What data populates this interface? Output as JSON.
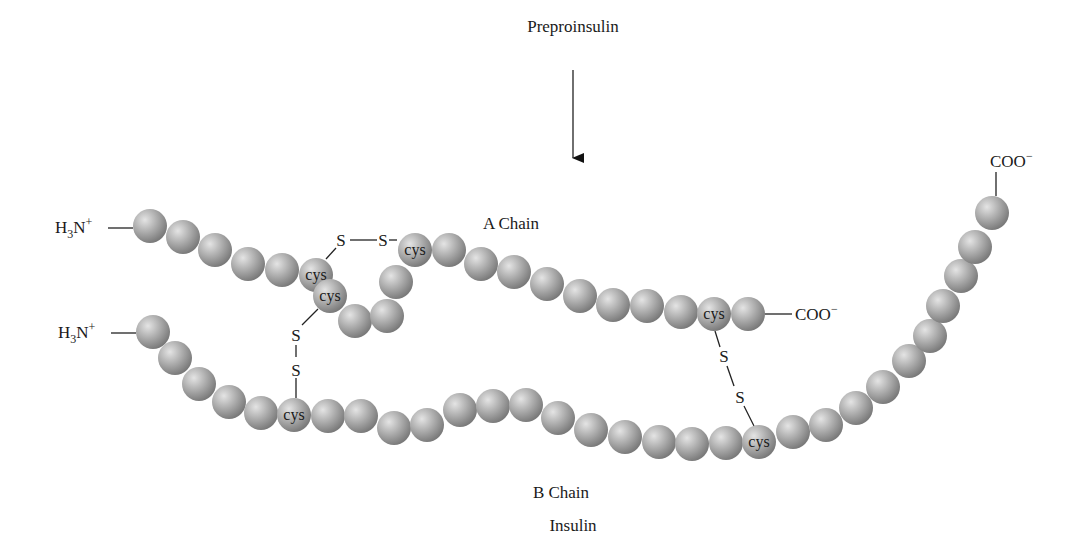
{
  "title_top": "Preproinsulin",
  "title_bottom": "Insulin",
  "colors": {
    "bead_light": "#d2d2d2",
    "bead_mid": "#a9a9a9",
    "bead_dark": "#7b7b7b",
    "text": "#1a1a1a",
    "background": "#ffffff"
  },
  "bead_radius": 17,
  "a_chain": {
    "label": "A Chain",
    "n_terminus": "H₃N⁺",
    "c_terminus": "COO⁻",
    "beads": [
      [
        150,
        226
      ],
      [
        183,
        237
      ],
      [
        215,
        250
      ],
      [
        248,
        264
      ],
      [
        282,
        270
      ],
      [
        316,
        275,
        "cys"
      ],
      [
        330,
        296,
        "cys"
      ],
      [
        355,
        321
      ],
      [
        387,
        316
      ],
      [
        396,
        282
      ],
      [
        415,
        250,
        "cys"
      ],
      [
        449,
        250
      ],
      [
        481,
        264
      ],
      [
        514,
        272
      ],
      [
        547,
        284
      ],
      [
        580,
        296
      ],
      [
        613,
        305
      ],
      [
        647,
        306
      ],
      [
        681,
        312
      ],
      [
        714,
        314,
        "cys"
      ],
      [
        748,
        314
      ]
    ]
  },
  "b_chain": {
    "label": "B Chain",
    "n_terminus": "H₃N⁺",
    "c_terminus": "COO⁻",
    "beads": [
      [
        153,
        332
      ],
      [
        175,
        358
      ],
      [
        199,
        384
      ],
      [
        229,
        402
      ],
      [
        261,
        413
      ],
      [
        294,
        415,
        "cys"
      ],
      [
        328,
        416
      ],
      [
        361,
        416
      ],
      [
        394,
        428
      ],
      [
        427,
        425
      ],
      [
        460,
        410
      ],
      [
        493,
        406
      ],
      [
        526,
        405
      ],
      [
        558,
        418
      ],
      [
        591,
        430
      ],
      [
        625,
        437
      ],
      [
        659,
        442
      ],
      [
        692,
        444
      ],
      [
        726,
        443
      ],
      [
        759,
        442,
        "cys"
      ],
      [
        793,
        432
      ],
      [
        826,
        425
      ],
      [
        856,
        408
      ],
      [
        883,
        387
      ],
      [
        909,
        361
      ],
      [
        930,
        336
      ],
      [
        943,
        306
      ],
      [
        961,
        276
      ],
      [
        975,
        247
      ],
      [
        992,
        213
      ]
    ]
  },
  "disulfides": [
    {
      "name": "interchain-top",
      "label_1": "S",
      "label_2": "S"
    },
    {
      "name": "intrachain-a",
      "label_1": "S",
      "label_2": "S"
    },
    {
      "name": "interchain-bottom",
      "label_1": "S",
      "label_2": "S"
    }
  ],
  "cys_label": "cys"
}
